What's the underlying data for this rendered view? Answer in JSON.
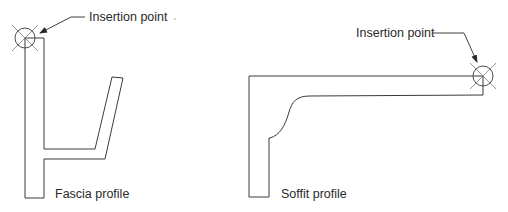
{
  "diagram": {
    "colors": {
      "stroke": "#3a3a3a",
      "text": "#2a2a2a",
      "background": "#ffffff"
    },
    "fascia": {
      "label": "Fascia profile",
      "insertion_label": "Insertion point"
    },
    "soffit": {
      "label": "Soffit profile",
      "insertion_label": "Insertion point"
    }
  }
}
